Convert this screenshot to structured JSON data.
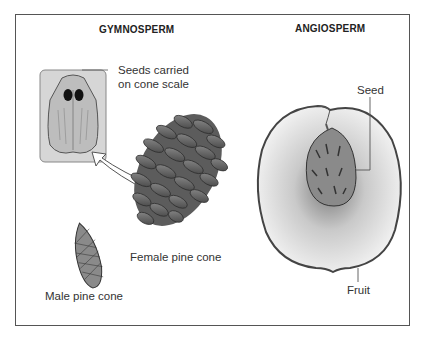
{
  "headings": {
    "left": "GYMNOSPERM",
    "right": "ANGIOSPERM"
  },
  "labels": {
    "cone_scale_line1": "Seeds carried",
    "cone_scale_line2": "on cone scale",
    "female_cone": "Female pine cone",
    "male_cone": "Male pine cone",
    "seed": "Seed",
    "fruit": "Fruit"
  },
  "colors": {
    "frame": "#555555",
    "inset_bg": "#d9d9d9",
    "cone": "#6e6e6e",
    "fruit_flesh": "#e6e6e6",
    "pit": "#8a8a8a"
  }
}
